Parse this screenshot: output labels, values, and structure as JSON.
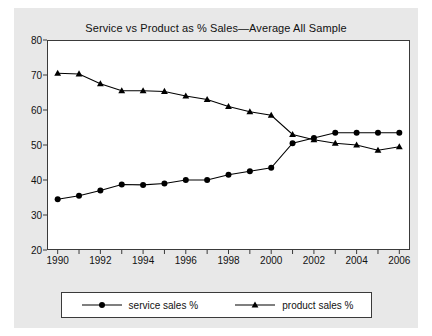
{
  "chart_data": {
    "type": "line",
    "title": "Service vs Product as % Sales—Average All Sample",
    "xlabel": "",
    "ylabel": "",
    "xlim": [
      1989.5,
      2006.5
    ],
    "ylim": [
      20,
      80
    ],
    "grid": false,
    "legend_position": "bottom",
    "x": [
      1990,
      1991,
      1992,
      1993,
      1994,
      1995,
      1996,
      1997,
      1998,
      1999,
      2000,
      2001,
      2002,
      2003,
      2004,
      2005,
      2006
    ],
    "xticks": [
      1990,
      1991,
      1992,
      1993,
      1994,
      1995,
      1996,
      1997,
      1998,
      1999,
      2000,
      2001,
      2002,
      2003,
      2004,
      2005,
      2006
    ],
    "xtick_labels": [
      "1990",
      "",
      "1992",
      "",
      "1994",
      "",
      "1996",
      "",
      "1998",
      "",
      "2000",
      "",
      "2002",
      "",
      "2004",
      "",
      "2006"
    ],
    "yticks": [
      20,
      30,
      40,
      50,
      60,
      70,
      80
    ],
    "ytick_labels": [
      "20",
      "30",
      "40",
      "50",
      "60",
      "70",
      "80"
    ],
    "series": [
      {
        "name": "service sales %",
        "marker": "circle",
        "color": "#000000",
        "values": [
          34.5,
          35.5,
          37.0,
          38.7,
          38.6,
          39.0,
          40.0,
          40.0,
          41.5,
          42.5,
          43.5,
          50.5,
          52.0,
          53.5,
          53.5,
          53.5,
          53.5
        ]
      },
      {
        "name": "product sales %",
        "marker": "triangle",
        "color": "#000000",
        "values": [
          70.5,
          70.3,
          67.5,
          65.5,
          65.5,
          65.3,
          64.0,
          63.0,
          61.0,
          59.5,
          58.5,
          53.0,
          51.5,
          50.5,
          50.0,
          48.5,
          49.5
        ]
      }
    ]
  },
  "legend": {
    "entries": [
      {
        "label": "service sales %"
      },
      {
        "label": "product sales %"
      }
    ]
  },
  "colors": {
    "figure_background": "#e8e8e8",
    "plot_background": "#ffffff",
    "axis": "#3a3a3a",
    "series": "#000000"
  }
}
